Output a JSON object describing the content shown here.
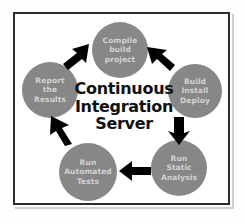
{
  "figure": {
    "title": "Continuous Integration Server",
    "center_text": "Continuous\nIntegration\nServer",
    "frame_color": "#2c2c2c",
    "background_color": "#ffffff",
    "node_fill_color": "#878787",
    "node_text_color": "#d3d3d3",
    "arrow_color": "#000000",
    "center_text_color": "#111111"
  },
  "nodes": [
    {
      "id": "compile",
      "label": "Compile\nbuild\nproject",
      "position": "top"
    },
    {
      "id": "build",
      "label": "Build\nInstall\nDeploy",
      "position": "right"
    },
    {
      "id": "static",
      "label": "Run\nStatic\nAnalysis",
      "position": "bottom-right"
    },
    {
      "id": "tests",
      "label": "Run\nAutomated\nTests",
      "position": "bottom-left"
    },
    {
      "id": "report",
      "label": "Report\nthe\nResults",
      "position": "left"
    }
  ],
  "arrows": [
    {
      "id": "report-to-compile",
      "from": "report",
      "to": "compile",
      "direction": "up-right"
    },
    {
      "id": "compile-to-build",
      "from": "compile",
      "to": "build",
      "direction": "down-right"
    },
    {
      "id": "build-to-static",
      "from": "build",
      "to": "static",
      "direction": "down"
    },
    {
      "id": "static-to-tests",
      "from": "static",
      "to": "tests",
      "direction": "left"
    },
    {
      "id": "tests-to-report",
      "from": "tests",
      "to": "report",
      "direction": "up-left"
    }
  ]
}
